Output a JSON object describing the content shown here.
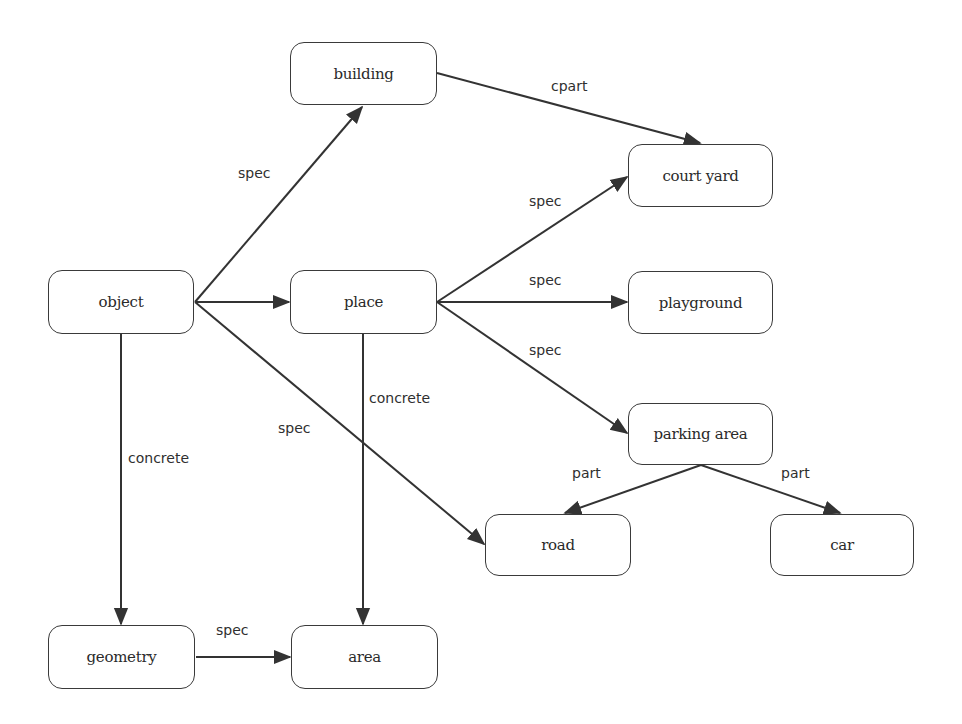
{
  "diagram": {
    "nodes": [
      {
        "id": "building",
        "label": "building",
        "x": 290,
        "y": 42,
        "w": 147,
        "h": 63
      },
      {
        "id": "object",
        "label": "object",
        "x": 48,
        "y": 270,
        "w": 146,
        "h": 64
      },
      {
        "id": "place",
        "label": "place",
        "x": 290,
        "y": 270,
        "w": 147,
        "h": 64
      },
      {
        "id": "court_yard",
        "label": "court yard",
        "x": 628,
        "y": 144,
        "w": 145,
        "h": 63
      },
      {
        "id": "playground",
        "label": "playground",
        "x": 628,
        "y": 271,
        "w": 145,
        "h": 63
      },
      {
        "id": "parking_area",
        "label": "parking area",
        "x": 628,
        "y": 403,
        "w": 145,
        "h": 62
      },
      {
        "id": "road",
        "label": "road",
        "x": 485,
        "y": 514,
        "w": 146,
        "h": 62
      },
      {
        "id": "car",
        "label": "car",
        "x": 770,
        "y": 514,
        "w": 144,
        "h": 62
      },
      {
        "id": "geometry",
        "label": "geometry",
        "x": 48,
        "y": 625,
        "w": 147,
        "h": 64
      },
      {
        "id": "area",
        "label": "area",
        "x": 291,
        "y": 625,
        "w": 147,
        "h": 64
      }
    ],
    "edges": [
      {
        "from": "object",
        "to": "building",
        "label": "spec",
        "x1": 195,
        "y1": 302,
        "x2": 362,
        "y2": 107,
        "lx": 238,
        "ly": 165
      },
      {
        "from": "object",
        "to": "place",
        "label": "",
        "x1": 195,
        "y1": 302,
        "x2": 289,
        "y2": 302,
        "lx": 0,
        "ly": 0
      },
      {
        "from": "object",
        "to": "road",
        "label": "spec",
        "x1": 195,
        "y1": 302,
        "x2": 484,
        "y2": 544,
        "lx": 278,
        "ly": 420
      },
      {
        "from": "object",
        "to": "geometry",
        "label": "concrete",
        "x1": 121,
        "y1": 334,
        "x2": 121,
        "y2": 624,
        "lx": 128,
        "ly": 450
      },
      {
        "from": "building",
        "to": "court_yard",
        "label": "cpart",
        "x1": 437,
        "y1": 73,
        "x2": 700,
        "y2": 143,
        "lx": 551,
        "ly": 78
      },
      {
        "from": "place",
        "to": "court_yard",
        "label": "spec",
        "x1": 437,
        "y1": 302,
        "x2": 627,
        "y2": 177,
        "lx": 529,
        "ly": 193
      },
      {
        "from": "place",
        "to": "playground",
        "label": "spec",
        "x1": 437,
        "y1": 302,
        "x2": 627,
        "y2": 302,
        "lx": 529,
        "ly": 272
      },
      {
        "from": "place",
        "to": "parking_area",
        "label": "spec",
        "x1": 437,
        "y1": 302,
        "x2": 627,
        "y2": 433,
        "lx": 529,
        "ly": 342
      },
      {
        "from": "place",
        "to": "area",
        "label": "concrete",
        "x1": 363,
        "y1": 334,
        "x2": 363,
        "y2": 624,
        "lx": 369,
        "ly": 390
      },
      {
        "from": "parking_area",
        "to": "road",
        "label": "part",
        "x1": 701,
        "y1": 465,
        "x2": 565,
        "y2": 513,
        "lx": 572,
        "ly": 465
      },
      {
        "from": "parking_area",
        "to": "car",
        "label": "part",
        "x1": 701,
        "y1": 465,
        "x2": 840,
        "y2": 513,
        "lx": 781,
        "ly": 465
      },
      {
        "from": "geometry",
        "to": "area",
        "label": "spec",
        "x1": 196,
        "y1": 657,
        "x2": 290,
        "y2": 657,
        "lx": 216,
        "ly": 622
      }
    ],
    "colors": {
      "stroke": "#333333",
      "background": "#ffffff",
      "text": "#2a2a2a"
    }
  }
}
